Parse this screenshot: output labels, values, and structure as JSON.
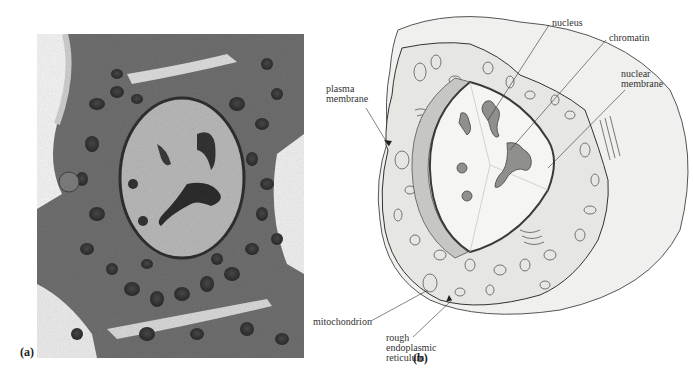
{
  "figure": {
    "panels": [
      {
        "id": "a",
        "label": "(a)",
        "type": "micrograph",
        "description": "transmission electron micrograph of a cell"
      },
      {
        "id": "b",
        "label": "(b)",
        "type": "diagram",
        "description": "cutaway drawing of a cell"
      }
    ],
    "labels": {
      "nucleus": "nucleus",
      "chromatin": "chromatin",
      "nuclear_membrane": "nuclear\nmembrane",
      "plasma_membrane": "plasma\nmembrane",
      "mitochondrion": "mitochondrion",
      "rough_er": "rough\nendoplasmic\nreticulum"
    },
    "colors": {
      "cell_fill": "#f1f1ef",
      "cytoplasm_fill": "#e6e6e3",
      "nucleus_band": "#c8c8c4",
      "chromatin_fill": "#8e8e8a",
      "line": "#333333",
      "micrograph_bg": "#6e6e6e"
    }
  }
}
